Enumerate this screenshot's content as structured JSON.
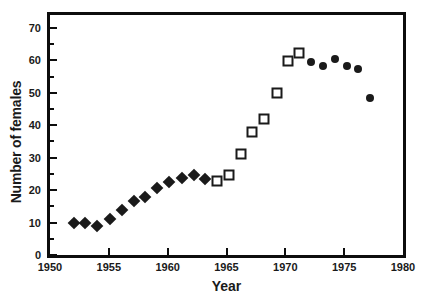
{
  "chart_data": {
    "type": "scatter",
    "title": "",
    "xlabel": "Year",
    "ylabel": "Number of females",
    "xlim": [
      1950,
      1980
    ],
    "ylim": [
      0,
      74
    ],
    "grid": false,
    "legend": "none",
    "x_ticks": [
      1950,
      1955,
      1960,
      1965,
      1970,
      1975,
      1980
    ],
    "x_tick_labels": [
      "1950",
      "1955",
      "1960",
      "1965",
      "1970",
      "1975",
      "1980"
    ],
    "x_minor_ticks": [
      1952.5,
      1957.5,
      1962.5,
      1967.5,
      1972.5,
      1977.5
    ],
    "y_ticks": [
      0,
      10,
      20,
      30,
      40,
      50,
      60,
      70
    ],
    "y_tick_labels": [
      "0",
      "10",
      "20",
      "30",
      "40",
      "50",
      "60",
      "70"
    ],
    "y_minor_ticks": [
      5,
      15,
      25,
      35,
      45,
      55,
      65
    ],
    "series": [
      {
        "name": "filled-diamond",
        "marker": "diamond",
        "fill": "#1a1a1a",
        "points": [
          {
            "x": 1952.0,
            "y": 10.0
          },
          {
            "x": 1953.0,
            "y": 10.0
          },
          {
            "x": 1954.0,
            "y": 9.0
          },
          {
            "x": 1955.1,
            "y": 11.0
          },
          {
            "x": 1956.1,
            "y": 14.0
          },
          {
            "x": 1957.1,
            "y": 16.8
          },
          {
            "x": 1958.1,
            "y": 18.0
          },
          {
            "x": 1959.1,
            "y": 20.7
          },
          {
            "x": 1960.1,
            "y": 22.5
          },
          {
            "x": 1961.2,
            "y": 23.7
          },
          {
            "x": 1962.2,
            "y": 24.7
          },
          {
            "x": 1963.2,
            "y": 23.5
          }
        ]
      },
      {
        "name": "open-square",
        "marker": "square",
        "fill": "#ffffff",
        "points": [
          {
            "x": 1964.2,
            "y": 22.7
          },
          {
            "x": 1965.2,
            "y": 24.8
          },
          {
            "x": 1966.2,
            "y": 31.0
          },
          {
            "x": 1967.2,
            "y": 38.0
          },
          {
            "x": 1968.2,
            "y": 42.0
          },
          {
            "x": 1969.3,
            "y": 49.8
          },
          {
            "x": 1970.2,
            "y": 59.8
          },
          {
            "x": 1971.2,
            "y": 62.4
          }
        ]
      },
      {
        "name": "filled-circle",
        "marker": "circle",
        "fill": "#1a1a1a",
        "points": [
          {
            "x": 1972.2,
            "y": 59.5
          },
          {
            "x": 1973.2,
            "y": 58.4
          },
          {
            "x": 1974.2,
            "y": 60.3
          },
          {
            "x": 1975.2,
            "y": 58.2
          },
          {
            "x": 1976.2,
            "y": 57.2
          },
          {
            "x": 1977.2,
            "y": 48.4
          }
        ]
      }
    ]
  },
  "colors": {
    "axis": "#0d0d0d",
    "marker": "#1a1a1a",
    "background": "#ffffff"
  }
}
